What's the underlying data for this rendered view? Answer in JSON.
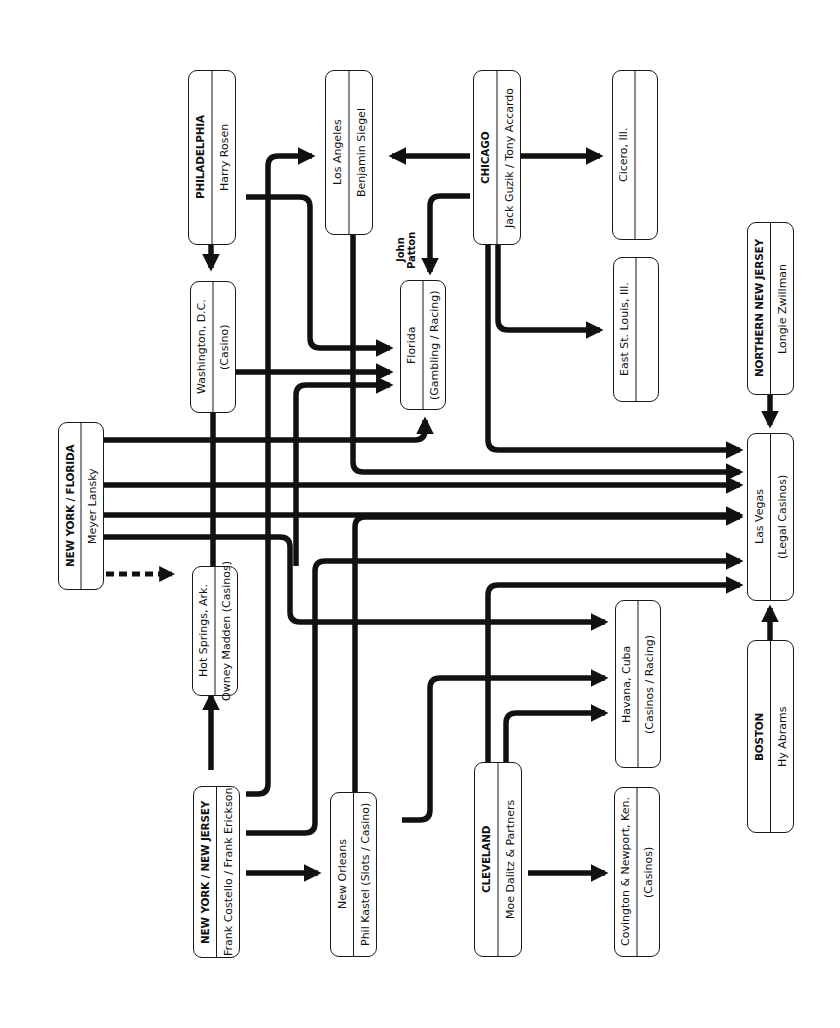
{
  "diagram": {
    "orientation": "rotated 90° counter-clockwise",
    "colors": {
      "line": "#111111",
      "box_border": "#1a1a1a",
      "background": "#ffffff"
    },
    "nodes": {
      "philadelphia": {
        "line1": "PHILADELPHIA",
        "line2": "Harry Rosen"
      },
      "los_angeles": {
        "line1": "Los Angeles",
        "line2": "Benjamin Siegel"
      },
      "chicago": {
        "line1": "CHICAGO",
        "line2": "Jack Guzik / Tony Accardo"
      },
      "cicero": {
        "line1": "Cicero, Ill.",
        "line2": ""
      },
      "washington": {
        "line1": "Washington, D.C.",
        "line2": "(Casino)"
      },
      "florida": {
        "line1": "Florida",
        "line2": "(Gambling / Racing)"
      },
      "east_st_louis": {
        "line1": "East St. Louis, Ill.",
        "line2": ""
      },
      "ny_florida": {
        "line1": "NEW YORK / FLORIDA",
        "line2": "Meyer Lansky"
      },
      "northern_nj": {
        "line1": "NORTHERN NEW JERSEY",
        "line2": "Longie Zwillman"
      },
      "hot_springs": {
        "line1": "Hot Springs, Ark.",
        "line2": "Owney Madden (Casinos)"
      },
      "las_vegas": {
        "line1": "Las Vegas",
        "line2": "(Legal Casinos)"
      },
      "ny_nj": {
        "line1": "NEW YORK / NEW JERSEY",
        "line2": "Frank Costello / Frank Erickson"
      },
      "new_orleans": {
        "line1": "New Orleans",
        "line2": "Phil Kastel (Slots / Casino)"
      },
      "cleveland": {
        "line1": "CLEVELAND",
        "line2": "Moe Dalitz & Partners"
      },
      "havana": {
        "line1": "Havana, Cuba",
        "line2": "(Casinos / Racing)"
      },
      "covington": {
        "line1": "Covington & Newport, Ken.",
        "line2": "(Casinos)"
      },
      "boston": {
        "line1": "BOSTON",
        "line2": "Hy Abrams"
      }
    },
    "annotations": {
      "john_patton": "John Patton"
    },
    "edges": [
      {
        "from": "Philadelphia",
        "to": "Washington, D.C."
      },
      {
        "from": "Philadelphia",
        "to": "Florida"
      },
      {
        "from": "Chicago",
        "to": "Los Angeles"
      },
      {
        "from": "Chicago",
        "to": "Cicero, Ill."
      },
      {
        "from": "Chicago",
        "to": "Florida",
        "label": "John Patton"
      },
      {
        "from": "Chicago",
        "to": "East St. Louis, Ill."
      },
      {
        "from": "Chicago",
        "to": "Las Vegas"
      },
      {
        "from": "Los Angeles",
        "to": "Las Vegas"
      },
      {
        "from": "New York / Florida",
        "to": "Florida"
      },
      {
        "from": "New York / Florida",
        "to": "Las Vegas"
      },
      {
        "from": "New York / Florida",
        "to": "Havana, Cuba"
      },
      {
        "from": "New York / Florida",
        "to": "Hot Springs, Ark.",
        "style": "dashed"
      },
      {
        "from": "Northern New Jersey",
        "to": "Las Vegas"
      },
      {
        "from": "Boston",
        "to": "Las Vegas"
      },
      {
        "from": "New York / New Jersey",
        "to": "Hot Springs, Ark."
      },
      {
        "from": "New York / New Jersey",
        "to": "Los Angeles"
      },
      {
        "from": "New York / New Jersey",
        "to": "Las Vegas"
      },
      {
        "from": "New York / New Jersey",
        "to": "New Orleans"
      },
      {
        "from": "Hot Springs, Ark.",
        "to": "Florida"
      },
      {
        "from": "New Orleans",
        "to": "Las Vegas"
      },
      {
        "from": "New Orleans",
        "to": "Havana, Cuba"
      },
      {
        "from": "Cleveland",
        "to": "Las Vegas"
      },
      {
        "from": "Cleveland",
        "to": "Havana, Cuba"
      },
      {
        "from": "Cleveland",
        "to": "Covington & Newport, Ken."
      }
    ]
  }
}
